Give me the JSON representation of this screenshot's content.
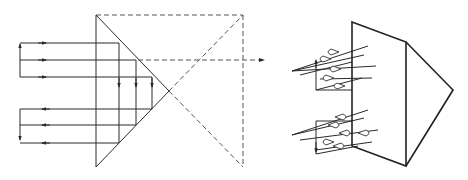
{
  "diagram": {
    "colors": {
      "line": "#2a2a2a",
      "dashed": "#555555",
      "background": "#ffffff"
    },
    "left_panel": {
      "prism": {
        "top": [
          96,
          15
        ],
        "apex": [
          169,
          91
        ],
        "bottom": [
          96,
          167
        ]
      },
      "unfolded_square": {
        "left": 96,
        "right": 243,
        "top": 15,
        "bottom": 167
      },
      "incoming_rays_y": [
        43,
        60,
        77
      ],
      "outgoing_rays_y": [
        109,
        125,
        143
      ],
      "ray_left_x": 20,
      "inner_verticals_x": [
        119,
        136,
        152
      ],
      "exit_arrow": {
        "y": 60,
        "from_x": 138,
        "to_x": 265
      }
    },
    "right_panel": {
      "prism_3d": {
        "front_top": [
          352,
          22
        ],
        "front_bottom": [
          352,
          146
        ],
        "back_top": [
          406,
          42
        ],
        "back_bottom": [
          406,
          166
        ],
        "apex": [
          453,
          90
        ]
      }
    }
  }
}
